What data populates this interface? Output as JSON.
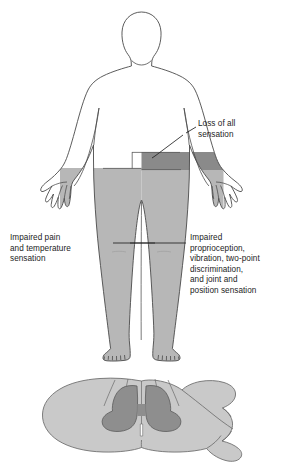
{
  "figure": {
    "type": "medical-diagram",
    "labels": {
      "loss_of_all": "Loss of all\nsensation",
      "impaired_pain": "Impaired pain\nand temperature\nsensation",
      "impaired_proprioception": "Impaired\nproprioception,\nvibration, two-point\ndiscrimination,\nand joint and\nposition sensation"
    },
    "colors": {
      "outline": "#4a4a4a",
      "light_shading": "#b7b7b7",
      "dark_shading": "#8a8a8a",
      "cord_white_matter": "#c9c9c9",
      "cord_gray_matter": "#8e8e8e",
      "leader_line": "#222222",
      "background": "#ffffff",
      "text": "#1c1c1c"
    },
    "regions": [
      {
        "name": "loss-of-all-sensation-band",
        "shading": "dark",
        "side": "right",
        "area": "waist band"
      },
      {
        "name": "impaired-pain-temperature-area",
        "shading": "light",
        "side": "left",
        "area": "left leg and hip"
      },
      {
        "name": "impaired-proprioception-area",
        "shading": "light",
        "side": "right",
        "area": "right leg and hip"
      }
    ],
    "cord": {
      "name": "spinal-cord-cross-section",
      "gray_matter": "butterfly-shaped central gray matter, darker shading",
      "white_matter": "surrounding oval white matter, lighter shading",
      "nerve_root": "tapering root extending to the right"
    }
  }
}
